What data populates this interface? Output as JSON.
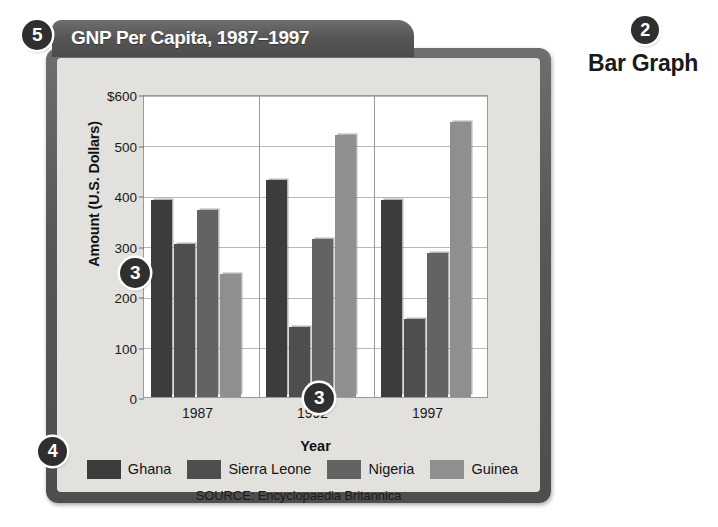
{
  "figure": {
    "title": "GNP Per Capita, 1987–1997",
    "source": "SOURCE: Encyclopaedia Britannica",
    "caption": "Bar Graph"
  },
  "callouts": [
    {
      "id": "5",
      "label": "5",
      "target": "figure-title-tab"
    },
    {
      "id": "2",
      "label": "2",
      "target": "graph-type-caption"
    },
    {
      "id": "3a",
      "label": "3",
      "target": "vertical-axis"
    },
    {
      "id": "3b",
      "label": "3",
      "target": "horizontal-axis"
    },
    {
      "id": "4",
      "label": "4",
      "target": "legend"
    }
  ],
  "chart_data": {
    "type": "bar",
    "title": "GNP Per Capita, 1987–1997",
    "xlabel": "Year",
    "ylabel": "Amount (U.S. Dollars)",
    "categories": [
      "1987",
      "1992",
      "1997"
    ],
    "xtick_labels": [
      "1987",
      "1992",
      "1997"
    ],
    "ytick_labels": [
      "0",
      "100",
      "200",
      "300",
      "400",
      "500",
      "$600"
    ],
    "yticks": [
      0,
      100,
      200,
      300,
      400,
      500,
      600
    ],
    "ylim": [
      0,
      600
    ],
    "grid": true,
    "legend_position": "bottom",
    "series": [
      {
        "name": "Ghana",
        "color": "#3c3c3c",
        "values": [
          390,
          430,
          390
        ]
      },
      {
        "name": "Sierra Leone",
        "color": "#4e4e4e",
        "values": [
          303,
          138,
          155
        ]
      },
      {
        "name": "Nigeria",
        "color": "#636363",
        "values": [
          370,
          313,
          285
        ]
      },
      {
        "name": "Guinea",
        "color": "#8f8f8f",
        "values": [
          243,
          518,
          545
        ]
      }
    ]
  }
}
